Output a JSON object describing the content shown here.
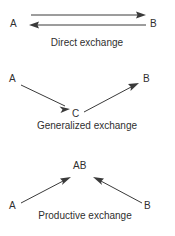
{
  "figure": {
    "background_color": "#ffffff",
    "ink_color": "#3a3a3a",
    "text_color": "#2f2f2f"
  },
  "panels": [
    {
      "id": "direct-exchange",
      "caption": "Direct exchange",
      "nodes": [
        {
          "id": "direct-a",
          "label": "A",
          "x": 14,
          "y": 23
        },
        {
          "id": "direct-b",
          "label": "B",
          "x": 152,
          "y": 23
        }
      ],
      "edges": [
        {
          "id": "direct-a-to-b",
          "from": "A",
          "to": "B",
          "direction": "right"
        },
        {
          "id": "direct-b-to-a",
          "from": "B",
          "to": "A",
          "direction": "left"
        }
      ]
    },
    {
      "id": "generalized-exchange",
      "caption": "Generalized exchange",
      "nodes": [
        {
          "id": "general-a",
          "label": "A",
          "x": 13,
          "y": 82
        },
        {
          "id": "general-b",
          "label": "B",
          "x": 145,
          "y": 82
        },
        {
          "id": "general-c",
          "label": "C",
          "x": 75,
          "y": 116
        }
      ],
      "edges": [
        {
          "id": "general-a-to-c",
          "from": "A",
          "to": "C",
          "direction": "down-right"
        },
        {
          "id": "general-c-to-b",
          "from": "C",
          "to": "B",
          "direction": "up-right"
        }
      ]
    },
    {
      "id": "productive-exchange",
      "caption": "Productive exchange",
      "nodes": [
        {
          "id": "productive-ab",
          "label": "AB",
          "x": 74,
          "y": 168
        },
        {
          "id": "productive-a",
          "label": "A",
          "x": 12,
          "y": 207
        },
        {
          "id": "productive-b",
          "label": "B",
          "x": 146,
          "y": 207
        }
      ],
      "edges": [
        {
          "id": "productive-a-to-ab",
          "from": "A",
          "to": "AB",
          "direction": "up-right"
        },
        {
          "id": "productive-b-to-ab",
          "from": "B",
          "to": "AB",
          "direction": "up-left"
        }
      ]
    }
  ],
  "labels": {
    "direct_a": "A",
    "direct_b": "B",
    "direct_caption": "Direct exchange",
    "general_a": "A",
    "general_b": "B",
    "general_c": "C",
    "general_caption": "Generalized exchange",
    "productive_ab": "AB",
    "productive_a": "A",
    "productive_b": "B",
    "productive_caption": "Productive exchange"
  }
}
